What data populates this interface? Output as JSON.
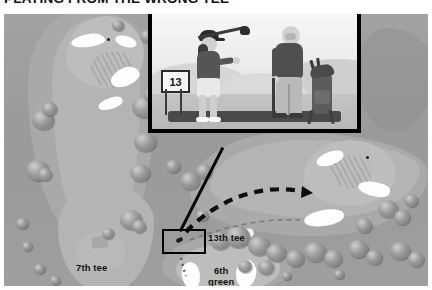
{
  "headline": {
    "text": "PLAYING FROM THE WRONG TEE"
  },
  "map": {
    "labels": [
      {
        "name": "7th tee",
        "text": "7th tee"
      },
      {
        "name": "13th tee",
        "text": "13th tee"
      },
      {
        "name": "6th green",
        "line1": "6th",
        "line2": "green"
      }
    ]
  },
  "inset": {
    "tee_sign_number": "13",
    "figures": [
      {
        "name": "golfer-with-club",
        "description": "golfer holding out a club"
      },
      {
        "name": "golfer-leaning",
        "description": "golfer leaning on a club"
      },
      {
        "name": "golf-bag",
        "description": "golf bag on a stand"
      }
    ]
  },
  "colors": {
    "rough": "#9d9d9d",
    "semirough": "#a9a9a9",
    "fairway": "#b4b4b4",
    "green": "#bdbdbd",
    "bunker": "#fdfdfd",
    "line": "#000000",
    "label_text": "#141414",
    "headline_text": "#111111"
  },
  "annotations": {
    "arc_primary": "thick black dashed shot trajectory",
    "arc_secondary": "thin light dashed shot trajectory",
    "leader_line": "line linking photo inset to 13th tee callout",
    "callout_box": "black rectangle marking the 13th tee"
  }
}
